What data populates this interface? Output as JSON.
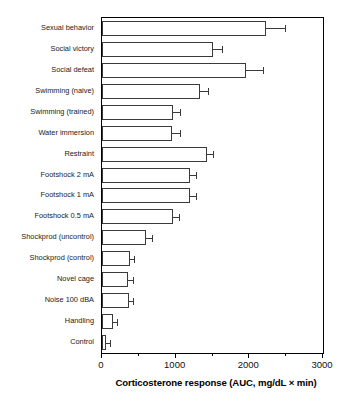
{
  "chart_data": {
    "type": "bar",
    "orientation": "horizontal",
    "title": "",
    "xlabel": "Corticosterone response (AUC, mg/dL × min)",
    "ylabel": "",
    "xlim": [
      0,
      3000
    ],
    "ylim": [
      0,
      16
    ],
    "grid": false,
    "legend": null,
    "x_ticks": [
      0,
      1000,
      2000,
      3000
    ],
    "x_tick_labels": [
      "0",
      "1000",
      "2000",
      "3000"
    ],
    "x_minor_ticks": [
      500,
      1500,
      2500
    ],
    "categories": [
      "Sexual behavior",
      "Social victory",
      "Social defeat",
      "Swimming (naive)",
      "Swimming (trained)",
      "Water immersion",
      "Restraint",
      "Footshock 2 mA",
      "Footshock 1 mA",
      "Footshock 0.5 mA",
      "Shockprod (uncontrol)",
      "Shockprod (control)",
      "Novel cage",
      "Noise 100 dBA",
      "Handling",
      "Control"
    ],
    "values": [
      2225,
      1500,
      1955,
      1330,
      960,
      955,
      1420,
      1200,
      1190,
      960,
      600,
      380,
      355,
      370,
      150,
      55
    ],
    "errors": [
      255,
      130,
      230,
      105,
      100,
      100,
      85,
      80,
      90,
      85,
      80,
      55,
      60,
      55,
      55,
      60
    ],
    "error_type": "SEM",
    "bar_facecolor": "#ffffff",
    "bar_edgecolor": "#3a3a3a",
    "axis_color": "#000000"
  },
  "figure": {
    "axis_title": "Corticosterone response (AUC, mg/dL × min)",
    "tick_labels": [
      "0",
      "1000",
      "2000",
      "3000"
    ],
    "category_labels": [
      "Sexual behavior",
      "Social victory",
      "Social defeat",
      "Swimming (naive)",
      "Swimming (trained)",
      "Water immersion",
      "Restraint",
      "Footshock 2 mA",
      "Footshock 1 mA",
      "Footshock 0.5 mA",
      "Shockprod (uncontrol)",
      "Shockprod (control)",
      "Novel cage",
      "Noise 100 dBA",
      "Handling",
      "Control"
    ]
  }
}
